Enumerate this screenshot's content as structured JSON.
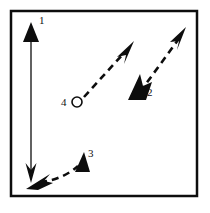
{
  "figure": {
    "type": "vector-diagram",
    "background_color": "#ffffff",
    "ink_color": "#0d0d0d",
    "frame": {
      "name": "figure-border",
      "x": 11,
      "y": 11,
      "width": 186,
      "height": 185,
      "stroke_width": 2.5,
      "fill": "none"
    },
    "labels": [
      {
        "id": "1",
        "text": "1",
        "x": 39,
        "y": 24
      },
      {
        "id": "2",
        "text": "2",
        "x": 147,
        "y": 96
      },
      {
        "id": "3",
        "text": "3",
        "x": 88,
        "y": 157
      },
      {
        "id": "4",
        "text": "4",
        "x": 61,
        "y": 106
      }
    ],
    "arrows": [
      {
        "id": "arrow-1",
        "label": "1",
        "style": "solid",
        "stroke_width": 1.4,
        "heads": "double",
        "head_top": "solid-triangle",
        "head_bottom": "thin-barb",
        "from": {
          "x": 31,
          "y": 180
        },
        "to": {
          "x": 31,
          "y": 27
        }
      },
      {
        "id": "arrow-2",
        "label": "2",
        "style": "dashed",
        "stroke_width": 2.6,
        "dash_pattern": "7 5",
        "heads": "double",
        "head_top": "thin-barb",
        "head_bottom": "solid-barb",
        "from": {
          "x": 137,
          "y": 96
        },
        "to": {
          "x": 182,
          "y": 33
        }
      },
      {
        "id": "arrow-3",
        "label": "3",
        "style": "dashed-curved",
        "stroke_width": 2.6,
        "dash_pattern": "7 5",
        "heads": "double",
        "head_start": "solid-barb",
        "head_end": "solid-triangle",
        "from": {
          "x": 33,
          "y": 182
        },
        "to": {
          "x": 81,
          "y": 160
        }
      },
      {
        "id": "arrow-4",
        "label": "4",
        "style": "dashed",
        "stroke_width": 2.6,
        "dash_pattern": "7 5",
        "heads": "single",
        "head_end": "thin-barb",
        "origin_marker": "open-circle",
        "from": {
          "x": 83,
          "y": 98
        },
        "to": {
          "x": 130,
          "y": 46
        }
      }
    ],
    "markers": [
      {
        "id": "circle-4",
        "name": "origin-circle",
        "cx": 77,
        "cy": 102,
        "r": 5,
        "fill": "#ffffff",
        "stroke_width": 1.6
      }
    ]
  }
}
